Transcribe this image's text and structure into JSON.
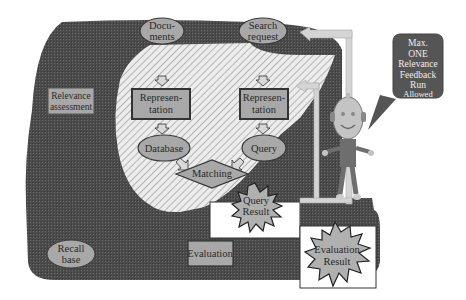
{
  "diagram": {
    "title": "",
    "colors": {
      "dark_region": "#4a4a4a",
      "hatched_region": "#e0e0e0",
      "node_fill": "#a8a8a8",
      "node_stroke": "#3a3a3a",
      "arrow_fill": "#d2d2d2",
      "callout_fill": "#555555",
      "robot_body": "#6e6e6e",
      "robot_head": "#c4c4c4"
    },
    "nodes": {
      "documents": {
        "line1": "Docu-",
        "line2": "ments",
        "shape": "ellipse"
      },
      "search_request": {
        "line1": "Search",
        "line2": "request",
        "shape": "ellipse"
      },
      "representation_left": {
        "line1": "Represen-",
        "line2": "tation",
        "shape": "rect"
      },
      "representation_right": {
        "line1": "Represen-",
        "line2": "tation",
        "shape": "rect"
      },
      "database": {
        "label": "Database",
        "shape": "ellipse"
      },
      "query": {
        "label": "Query",
        "shape": "ellipse"
      },
      "matching": {
        "label": "Matching",
        "shape": "diamond"
      },
      "query_result": {
        "line1": "Query",
        "line2": "Result",
        "shape": "starburst"
      },
      "relevance_assessment": {
        "line1": "Relevance",
        "line2": "assessment",
        "shape": "rect"
      },
      "recall_base": {
        "line1": "Recall",
        "line2": "base",
        "shape": "ellipse"
      },
      "evaluation": {
        "label": "Evaluation",
        "shape": "rect"
      },
      "evaluation_result": {
        "line1": "Evaluation",
        "line2": "Result",
        "shape": "starburst"
      }
    },
    "callout": {
      "lines": [
        "Max.",
        "ONE",
        "Relevance",
        "Feedback",
        "Run",
        "Allowed"
      ]
    },
    "edges": [
      {
        "from": "documents",
        "to": "representation_left"
      },
      {
        "from": "search_request",
        "to": "representation_right"
      },
      {
        "from": "representation_left",
        "to": "database"
      },
      {
        "from": "representation_right",
        "to": "query"
      },
      {
        "from": "database",
        "to": "matching"
      },
      {
        "from": "query",
        "to": "matching"
      },
      {
        "from": "user",
        "to": "search_request"
      },
      {
        "from": "user",
        "to": "representation_right"
      },
      {
        "from": "query_result",
        "to": "user"
      }
    ]
  }
}
